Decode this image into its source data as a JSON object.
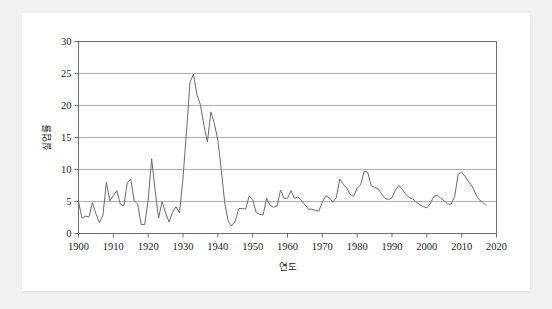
{
  "figure": {
    "background_color": "#f1f1f1",
    "card_color": "#ffffff",
    "line_color": "#6b6b6b",
    "axis_color": "#6e6e6e",
    "grid_color": "#9a9a9a",
    "text_color": "#1b1b1b"
  },
  "chart_data": {
    "type": "line",
    "title": "",
    "subtitle": "",
    "xlabel": "연도",
    "ylabel": "실업률",
    "xlim": [
      1900,
      2020
    ],
    "ylim": [
      0,
      30
    ],
    "xticks": [
      1900,
      1910,
      1920,
      1930,
      1940,
      1950,
      1960,
      1970,
      1980,
      1990,
      2000,
      2010,
      2020
    ],
    "xticklabels": [
      "1900",
      "1910",
      "1920",
      "1930",
      "1940",
      "1950",
      "1960",
      "1970",
      "1980",
      "1990",
      "2000",
      "2010",
      "2020"
    ],
    "yticks": [
      0,
      5,
      10,
      15,
      20,
      25,
      30
    ],
    "yticklabels": [
      "0",
      "5",
      "10",
      "15",
      "20",
      "25",
      "30"
    ],
    "grid": "horizontal",
    "legend": "none",
    "series": [
      {
        "name": "실업률",
        "x": [
          1900,
          1901,
          1902,
          1903,
          1904,
          1905,
          1906,
          1907,
          1908,
          1909,
          1910,
          1911,
          1912,
          1913,
          1914,
          1915,
          1916,
          1917,
          1918,
          1919,
          1920,
          1921,
          1922,
          1923,
          1924,
          1925,
          1926,
          1927,
          1928,
          1929,
          1930,
          1931,
          1932,
          1933,
          1934,
          1935,
          1936,
          1937,
          1938,
          1939,
          1940,
          1941,
          1942,
          1943,
          1944,
          1945,
          1946,
          1947,
          1948,
          1949,
          1950,
          1951,
          1952,
          1953,
          1954,
          1955,
          1956,
          1957,
          1958,
          1959,
          1960,
          1961,
          1962,
          1963,
          1964,
          1965,
          1966,
          1967,
          1968,
          1969,
          1970,
          1971,
          1972,
          1973,
          1974,
          1975,
          1976,
          1977,
          1978,
          1979,
          1980,
          1981,
          1982,
          1983,
          1984,
          1985,
          1986,
          1987,
          1988,
          1989,
          1990,
          1991,
          1992,
          1993,
          1994,
          1995,
          1996,
          1997,
          1998,
          1999,
          2000,
          2001,
          2002,
          2003,
          2004,
          2005,
          2006,
          2007,
          2008,
          2009,
          2010,
          2011,
          2012,
          2013,
          2014,
          2015,
          2016,
          2017
        ],
        "y": [
          5.0,
          2.4,
          2.7,
          2.6,
          4.8,
          3.1,
          1.7,
          2.8,
          8.0,
          5.1,
          5.9,
          6.7,
          4.6,
          4.3,
          7.9,
          8.5,
          5.1,
          4.6,
          1.4,
          1.4,
          5.2,
          11.7,
          6.7,
          2.4,
          5.0,
          3.2,
          1.8,
          3.3,
          4.2,
          3.2,
          8.7,
          15.9,
          23.6,
          24.9,
          21.7,
          20.1,
          16.9,
          14.3,
          19.0,
          17.2,
          14.6,
          9.9,
          4.7,
          1.9,
          1.2,
          1.9,
          3.9,
          3.9,
          3.8,
          5.9,
          5.3,
          3.3,
          3.0,
          2.9,
          5.5,
          4.4,
          4.1,
          4.3,
          6.8,
          5.5,
          5.5,
          6.7,
          5.5,
          5.7,
          5.2,
          4.5,
          3.8,
          3.8,
          3.6,
          3.5,
          4.9,
          5.9,
          5.6,
          4.9,
          5.6,
          8.5,
          7.7,
          7.1,
          6.1,
          5.8,
          7.1,
          7.6,
          9.7,
          9.6,
          7.5,
          7.2,
          7.0,
          6.2,
          5.5,
          5.3,
          5.6,
          6.8,
          7.5,
          6.9,
          6.1,
          5.6,
          5.4,
          4.9,
          4.5,
          4.2,
          4.0,
          4.7,
          5.8,
          6.0,
          5.5,
          5.1,
          4.6,
          4.6,
          5.8,
          9.3,
          9.6,
          8.9,
          8.1,
          7.4,
          6.2,
          5.3,
          4.9,
          4.4
        ]
      }
    ]
  }
}
